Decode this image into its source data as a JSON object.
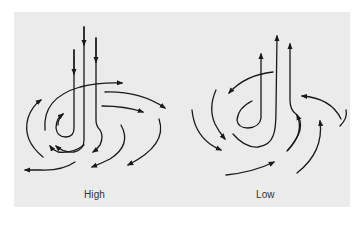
{
  "figure": {
    "background_color": "#ebebeb",
    "stroke_color": "#1a1a1a",
    "label_color": "#333333"
  },
  "diagrams": [
    {
      "id": "high",
      "label": "High",
      "description": "Descending air spirals outward (clockwise divergence)",
      "vertical_arrows_direction": "down",
      "vertical_arrow_count": 3,
      "spiral_arrow_count": 10
    },
    {
      "id": "low",
      "label": "Low",
      "description": "Converging air spirals inward and rises",
      "vertical_arrows_direction": "up",
      "vertical_arrow_count": 3,
      "spiral_arrow_count": 8
    }
  ]
}
